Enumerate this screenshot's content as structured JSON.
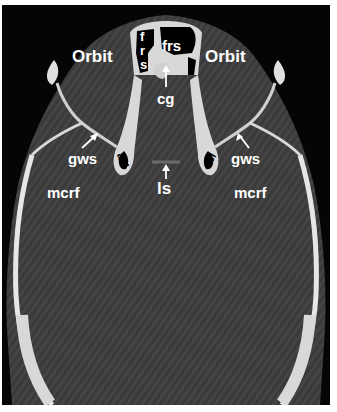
{
  "image": {
    "type": "axial CT scan of skull base",
    "background_color": "#050505",
    "brain_tissue_color": "#3c3c3c",
    "bone_color": "#e8e8e8",
    "label_color": "#ffffff"
  },
  "labels": {
    "orbit_left": "Orbit",
    "orbit_right": "Orbit",
    "frs_vertical_1": "f",
    "frs_vertical_2": "r",
    "frs_vertical_3": "s",
    "frs": "frs",
    "cg": "cg",
    "gws_left": "gws",
    "gws_right": "gws",
    "acl_left": "acl",
    "acl_right": "acl",
    "ls": "ls",
    "mcrf_left": "mcrf",
    "mcrf_right": "mcrf"
  }
}
